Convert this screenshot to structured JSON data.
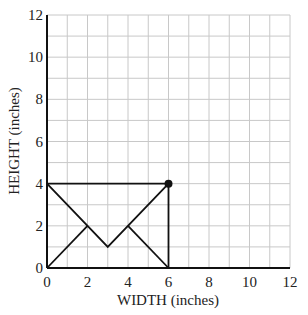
{
  "chart_data": {
    "type": "line",
    "title": "",
    "xlabel": "WIDTH (inches)",
    "ylabel": "HEIGHT (inches)",
    "xlim": [
      0,
      12
    ],
    "ylim": [
      0,
      12
    ],
    "grid": true,
    "grid_step": 1,
    "x_ticks": [
      0,
      2,
      4,
      6,
      8,
      10,
      12
    ],
    "y_ticks": [
      0,
      2,
      4,
      6,
      8,
      10,
      12
    ],
    "shapes": [
      {
        "name": "envelope-outline",
        "points": [
          [
            0,
            0
          ],
          [
            6,
            0
          ],
          [
            6,
            4
          ],
          [
            0,
            4
          ],
          [
            0,
            0
          ]
        ]
      },
      {
        "name": "envelope-flap",
        "points": [
          [
            0,
            4
          ],
          [
            3,
            1
          ],
          [
            6,
            4
          ]
        ]
      },
      {
        "name": "left-fold",
        "points": [
          [
            0,
            0
          ],
          [
            2,
            2
          ]
        ]
      },
      {
        "name": "right-fold",
        "points": [
          [
            6,
            0
          ],
          [
            4,
            2
          ]
        ]
      }
    ],
    "highlighted_point": {
      "x": 6,
      "y": 4
    },
    "colors": {
      "grid": "#c8c8c8",
      "lines": "#111111",
      "axis": "#111111"
    }
  }
}
